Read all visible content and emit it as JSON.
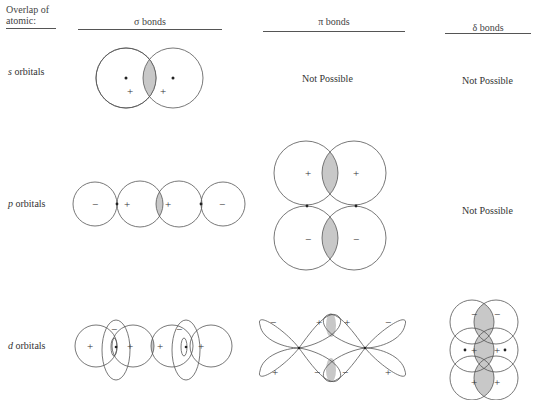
{
  "header": {
    "corner_label_line1": "Overlap of",
    "corner_label_line2": "atomic:",
    "columns": [
      {
        "label": "σ bonds"
      },
      {
        "label": "π bonds"
      },
      {
        "label": "δ bonds"
      }
    ]
  },
  "rows": [
    {
      "label": "s orbitals",
      "label_italic_part": "s",
      "label_rest": " orbitals",
      "sigma": "diagram",
      "pi": "Not Possible",
      "delta": "Not Possible"
    },
    {
      "label": "p orbitals",
      "label_italic_part": "p",
      "label_rest": " orbitals",
      "sigma": "diagram",
      "pi": "diagram",
      "delta": "Not Possible"
    },
    {
      "label": "d orbitals",
      "label_italic_part": "d",
      "label_rest": " orbitals",
      "sigma": "diagram",
      "pi": "diagram",
      "delta": "diagram"
    }
  ],
  "signs": {
    "plus": "+",
    "minus": "−"
  },
  "colors": {
    "overlap_fill": "#c8c8c8",
    "stroke": "#555555"
  }
}
